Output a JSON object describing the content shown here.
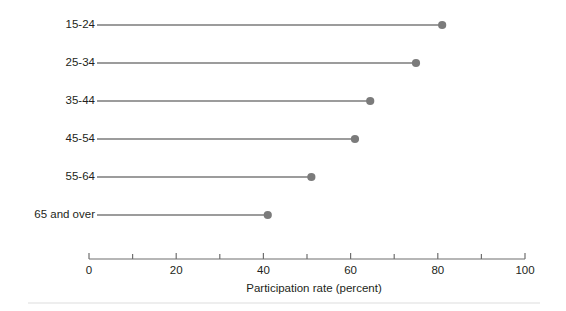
{
  "chart_data": {
    "type": "bar",
    "subtype": "lollipop-dot-plot",
    "orientation": "horizontal",
    "title": "",
    "subtitle": "",
    "xlabel": "Participation rate (percent)",
    "ylabel": "",
    "categories": [
      "15-24",
      "25-34",
      "35-44",
      "45-54",
      "55-64",
      "65 and over"
    ],
    "values": [
      81,
      75,
      64.5,
      61,
      51,
      41
    ],
    "series": [
      {
        "name": "Participation rate",
        "values": [
          81,
          75,
          64.5,
          61,
          51,
          41
        ]
      }
    ],
    "xlim": [
      0,
      100
    ],
    "xticks": [
      0,
      20,
      40,
      60,
      80,
      100
    ],
    "xtick_labels": [
      "0",
      "20",
      "40",
      "60",
      "80",
      "100"
    ],
    "xminor_ticks": [
      10,
      30,
      50,
      70,
      90
    ],
    "grid": false,
    "legend": false,
    "legend_position": "none",
    "annotations": [],
    "colors": {
      "marker": "#7b7b7b",
      "stem": "#7b7b7b",
      "axis": "#6f6f6f",
      "text": "#231f20",
      "background": "#ffffff",
      "footer_rule": "#e9e9e9"
    }
  }
}
